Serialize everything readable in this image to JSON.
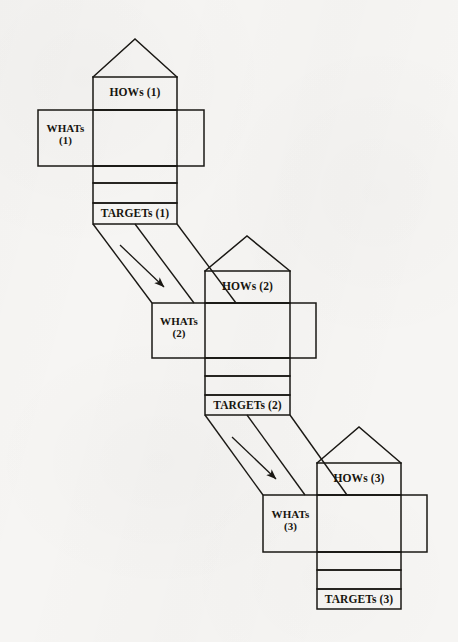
{
  "figure": {
    "type": "qfd-house-of-quality-cascade",
    "title": "",
    "background_color": "#f6f5f3",
    "line_color": "#1a1814",
    "text_color": "#17150f",
    "phase_count": 3
  },
  "houses": [
    {
      "id": "house-1",
      "index": 1,
      "hows_label": "HOWs (1)",
      "whats_label": "WHATs\n(1)",
      "targets_label": "TARGETs (1)",
      "roof": {
        "peak_x": 135,
        "peak_y": 39,
        "left_x": 93,
        "right_x": 177,
        "base_y": 77
      },
      "hows_box": {
        "x": 93,
        "y": 77,
        "w": 84,
        "h": 33
      },
      "matrix_box": {
        "x": 93,
        "y": 110,
        "w": 84,
        "h": 56
      },
      "whats_band": {
        "x": 38,
        "y": 110,
        "w": 166,
        "h": 56
      },
      "rows": [
        {
          "name": "row-a",
          "x": 93,
          "y": 166,
          "w": 84,
          "h": 17
        },
        {
          "name": "row-b",
          "x": 93,
          "y": 183,
          "w": 84,
          "h": 20
        },
        {
          "name": "targets-row",
          "x": 93,
          "y": 203,
          "w": 84,
          "h": 21
        }
      ]
    },
    {
      "id": "house-2",
      "index": 2,
      "hows_label": "HOWs (2)",
      "whats_label": "WHATs\n(2)",
      "targets_label": "TARGETs (2)",
      "roof": {
        "peak_x": 247,
        "peak_y": 236,
        "left_x": 205,
        "right_x": 290,
        "base_y": 271
      },
      "hows_box": {
        "x": 205,
        "y": 271,
        "w": 85,
        "h": 32
      },
      "matrix_box": {
        "x": 205,
        "y": 303,
        "w": 85,
        "h": 55
      },
      "whats_band": {
        "x": 152,
        "y": 303,
        "w": 164,
        "h": 55
      },
      "rows": [
        {
          "name": "row-a",
          "x": 205,
          "y": 358,
          "w": 85,
          "h": 18
        },
        {
          "name": "row-b",
          "x": 205,
          "y": 376,
          "w": 85,
          "h": 19
        },
        {
          "name": "targets-row",
          "x": 205,
          "y": 395,
          "w": 85,
          "h": 20
        }
      ]
    },
    {
      "id": "house-3",
      "index": 3,
      "hows_label": "HOWs (3)",
      "whats_label": "WHATs\n(3)",
      "targets_label": "TARGETs (3)",
      "roof": {
        "peak_x": 359,
        "peak_y": 427,
        "left_x": 317,
        "right_x": 401,
        "base_y": 463
      },
      "hows_box": {
        "x": 317,
        "y": 463,
        "w": 84,
        "h": 32
      },
      "matrix_box": {
        "x": 317,
        "y": 495,
        "w": 84,
        "h": 57
      },
      "whats_band": {
        "x": 263,
        "y": 495,
        "w": 164,
        "h": 57
      },
      "rows": [
        {
          "name": "row-a",
          "x": 317,
          "y": 552,
          "w": 84,
          "h": 18
        },
        {
          "name": "row-b",
          "x": 317,
          "y": 570,
          "w": 84,
          "h": 19
        },
        {
          "name": "targets-row",
          "x": 317,
          "y": 589,
          "w": 84,
          "h": 20
        }
      ]
    }
  ],
  "connectors": [
    {
      "id": "deployment-1-to-2",
      "from": "TARGETs (1)",
      "to": "WHATs (2)",
      "left_line": {
        "x1": 93,
        "y1": 224,
        "x2": 152,
        "y2": 303
      },
      "mid_line": {
        "x1": 135,
        "y1": 224,
        "x2": 194,
        "y2": 303
      },
      "right_line": {
        "x1": 177,
        "y1": 224,
        "x2": 236,
        "y2": 303
      },
      "arrow": {
        "x1": 120,
        "y1": 245,
        "x2": 166,
        "y2": 289
      }
    },
    {
      "id": "deployment-2-to-3",
      "from": "TARGETs (2)",
      "to": "WHATs (3)",
      "left_line": {
        "x1": 205,
        "y1": 415,
        "x2": 263,
        "y2": 495
      },
      "mid_line": {
        "x1": 247,
        "y1": 415,
        "x2": 305,
        "y2": 495
      },
      "right_line": {
        "x1": 290,
        "y1": 415,
        "x2": 347,
        "y2": 495
      },
      "arrow": {
        "x1": 232,
        "y1": 437,
        "x2": 278,
        "y2": 481
      }
    }
  ]
}
